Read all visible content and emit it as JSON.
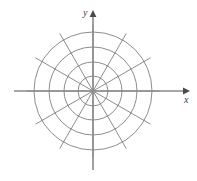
{
  "figure": {
    "kind": "polar-coordinate-grid",
    "width": 197,
    "height": 181,
    "background_color": "#ffffff"
  },
  "labels": {
    "x_axis": "x",
    "y_axis": "y"
  },
  "chart_data": {
    "type": "scatter",
    "title": "",
    "subtitle": "",
    "xlabel": "x",
    "ylabel": "y",
    "coordinate_system": "polar",
    "grid": true,
    "legend": null,
    "series": [],
    "values": [],
    "categories": [],
    "annotations": [],
    "polar_grid": {
      "center_x": 93,
      "center_y": 91,
      "circle_count": 4,
      "circle_radii": [
        15,
        29,
        44,
        59
      ],
      "radial_line_count": 12,
      "radial_angles_deg": [
        0,
        30,
        60,
        90,
        120,
        150,
        180,
        210,
        240,
        270,
        300,
        330
      ],
      "radial_line_length": 66,
      "grid_color": "#6e6e6e",
      "grid_stroke_width": 0.8
    },
    "axes": {
      "color": "#8a8a8a",
      "stroke_width": 1.6,
      "x_start_x": 14,
      "x_end_x": 186,
      "x_y": 91,
      "y_top_y": 14,
      "y_bottom_y": 170,
      "y_x": 93,
      "arrowheads": [
        "x-positive",
        "y-positive"
      ]
    },
    "xlim": [
      -3.2,
      3.2
    ],
    "ylim": [
      -3.0,
      3.0
    ]
  }
}
